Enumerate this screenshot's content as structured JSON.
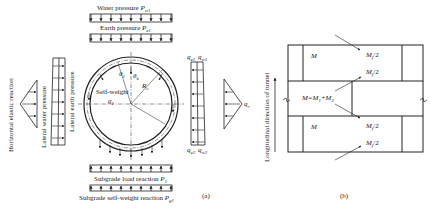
{
  "figure_a": {
    "top_loads": {
      "water_pressure": {
        "label": "Water pressure",
        "symbol": "P",
        "sub": "w1"
      },
      "earth_pressure": {
        "label": "Earth pressure",
        "symbol": "P",
        "sub": "e1"
      }
    },
    "left_loads": {
      "horizontal_elastic_reaction": "Horizontal elastic reaction",
      "lateral_water_pressure": "Lateral water pressure",
      "lateral_earth_pressure": "Lateral earth pressure"
    },
    "circle": {
      "self_weight": "Self-weight",
      "g_symbol": "g",
      "g_sub": "1",
      "theta_left": "θ",
      "theta_left_sub": "1",
      "theta_right": "θ",
      "theta_right_sub": "k",
      "radius": "R",
      "radius_sub": "c"
    },
    "right_loads": {
      "q_e1_top": {
        "symbol": "q",
        "sub": "e1"
      },
      "q_w1_top": {
        "symbol": "q",
        "sub": "w1"
      },
      "q_e2_bottom": {
        "symbol": "q",
        "sub": "e2"
      },
      "q_w2_bottom": {
        "symbol": "q",
        "sub": "w2"
      },
      "q_r": {
        "symbol": "q",
        "sub": "r"
      }
    },
    "bottom_loads": {
      "subgrade_load_reaction": {
        "label": "Subgrade load reaction",
        "symbol": "P",
        "sub": "1"
      },
      "subgrade_self_weight_reaction": {
        "label": "Subgrade self-weight reaction",
        "symbol": "P",
        "sub": "g1"
      }
    },
    "caption": "(a)"
  },
  "figure_b": {
    "axis_label": "Longitudinal direction of tunnel",
    "top_ring": {
      "M": "M",
      "upper": "M",
      "upper_sub": "f",
      "upper_suffix": "/2",
      "lower": "M",
      "lower_sub": "f",
      "lower_suffix": "/2"
    },
    "middle_ring": {
      "eq": "M=M",
      "eq_sub1": "1",
      "plus": "+M",
      "eq_sub2": "2"
    },
    "bottom_ring": {
      "M": "M",
      "upper": "M",
      "upper_sub": "f",
      "upper_suffix": "/2",
      "lower": "M",
      "lower_sub": "f",
      "lower_suffix": "/2"
    },
    "caption": "(b)"
  }
}
